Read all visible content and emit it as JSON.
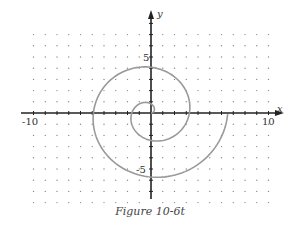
{
  "chart_data": {
    "type": "line",
    "title": "",
    "caption": "Figure 10-6t",
    "xlabel": "x",
    "ylabel": "y",
    "xlim": [
      -10,
      10
    ],
    "ylim": [
      -7,
      9
    ],
    "grid": "dots",
    "x_tick_labels": [
      "-10",
      "10"
    ],
    "y_tick_labels": [
      "5",
      "-5"
    ],
    "curve": {
      "kind": "polar spiral r = 0.52·θ",
      "theta_range": [
        0,
        12.566
      ],
      "key_points": [
        {
          "x": 3.3,
          "y": 0
        },
        {
          "x": 0,
          "y": 3.9
        },
        {
          "x": -4.6,
          "y": 0
        },
        {
          "x": 0,
          "y": -5.4
        },
        {
          "x": 6.5,
          "y": 0
        }
      ],
      "color": "#999999"
    }
  },
  "caption": "Figure 10-6t",
  "labels": {
    "x_axis": "x",
    "y_axis": "y",
    "x_min": "-10",
    "x_max": "10",
    "y_pos": "5",
    "y_neg": "-5"
  }
}
